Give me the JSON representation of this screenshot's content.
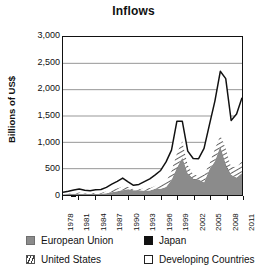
{
  "chart_data": {
    "type": "area",
    "title": "Inflows",
    "xlabel": "",
    "ylabel": "Billions of US$",
    "ylim": [
      0,
      3000
    ],
    "xlim": [
      1978,
      2011
    ],
    "ytick_labels": [
      "0",
      "500",
      "1,000",
      "1,500",
      "2,000",
      "2,500",
      "3,000"
    ],
    "ytick_values": [
      0,
      500,
      1000,
      1500,
      2000,
      2500,
      3000
    ],
    "xtick_labels": [
      "1978",
      "1981",
      "1984",
      "1987",
      "1990",
      "1993",
      "1996",
      "1999",
      "2002",
      "2005",
      "2008",
      "2011"
    ],
    "xtick_values": [
      1978,
      1981,
      1984,
      1987,
      1990,
      1993,
      1996,
      1999,
      2002,
      2005,
      2008,
      2011
    ],
    "grid": "horizontal",
    "legend_position": "below",
    "stacked": true,
    "x": [
      1978,
      1979,
      1980,
      1981,
      1982,
      1983,
      1984,
      1985,
      1986,
      1987,
      1988,
      1989,
      1990,
      1991,
      1992,
      1993,
      1994,
      1995,
      1996,
      1997,
      1998,
      1999,
      2000,
      2001,
      2002,
      2003,
      2004,
      2005,
      2006,
      2007,
      2008,
      2009,
      2010,
      2011
    ],
    "series": [
      {
        "name": "European Union",
        "color": "#8b8b8b",
        "values": [
          14,
          18,
          22,
          24,
          18,
          17,
          19,
          22,
          32,
          50,
          70,
          90,
          105,
          90,
          85,
          80,
          85,
          120,
          120,
          150,
          280,
          500,
          700,
          400,
          300,
          290,
          230,
          480,
          640,
          900,
          560,
          370,
          330,
          420
        ]
      },
      {
        "name": "Japan",
        "color": "#111111",
        "values": [
          0,
          0,
          0,
          1,
          1,
          1,
          0,
          1,
          1,
          1,
          0,
          1,
          2,
          1,
          3,
          0,
          1,
          0,
          0,
          3,
          3,
          12,
          8,
          6,
          9,
          6,
          8,
          3,
          0,
          23,
          24,
          12,
          0,
          0
        ]
      },
      {
        "name": "United States",
        "color": "#3a3a3a",
        "values": [
          8,
          12,
          17,
          25,
          14,
          12,
          26,
          20,
          36,
          59,
          58,
          70,
          48,
          23,
          19,
          51,
          46,
          58,
          86,
          105,
          179,
          289,
          321,
          167,
          84,
          64,
          146,
          113,
          243,
          216,
          306,
          153,
          206,
          227
        ]
      },
      {
        "name": "Developing Countries",
        "color": "#ffffff",
        "values": [
          30,
          40,
          55,
          65,
          58,
          52,
          55,
          62,
          75,
          95,
          130,
          160,
          95,
          70,
          93,
          122,
          175,
          205,
          260,
          370,
          390,
          600,
          370,
          260,
          300,
          330,
          500,
          740,
          900,
          1210,
          1320,
          880,
          1000,
          1200
        ]
      }
    ],
    "total": {
      "name": "Total inflows",
      "values": [
        52,
        70,
        94,
        115,
        91,
        82,
        100,
        105,
        144,
        205,
        258,
        321,
        250,
        184,
        200,
        253,
        307,
        383,
        466,
        628,
        852,
        1401,
        1399,
        833,
        693,
        690,
        884,
        1336,
        1783,
        2349,
        2210,
        1415,
        1536,
        1847
      ]
    },
    "annotations": [
      {
        "label": "peak",
        "x": 1999,
        "y": 1401
      },
      {
        "label": "peak",
        "x": 2007,
        "y": 2349
      }
    ]
  },
  "legend": {
    "items": [
      {
        "label": "European Union",
        "swatch": "solid-gray-swatch"
      },
      {
        "label": "Japan",
        "swatch": "solid-black-swatch"
      },
      {
        "label": "United States",
        "swatch": "hatched-swatch"
      },
      {
        "label": "Developing Countries",
        "swatch": "outline-white-swatch"
      }
    ]
  }
}
